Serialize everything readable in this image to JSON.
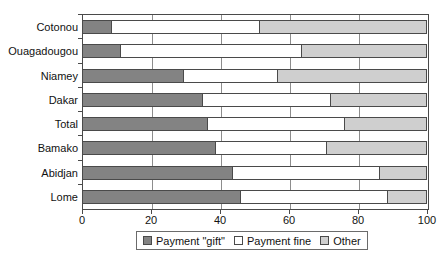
{
  "chart_data": {
    "type": "bar",
    "orientation": "horizontal",
    "stacked": true,
    "stack_mode": "percent",
    "title": "",
    "xlabel": "",
    "ylabel": "",
    "xlim": [
      0,
      100
    ],
    "xticks": [
      0,
      20,
      40,
      60,
      80,
      100
    ],
    "xtick_labels": [
      "0",
      "20",
      "40",
      "60",
      "80",
      "100"
    ],
    "grid": "vertical",
    "legend_position": "bottom",
    "categories": [
      "Cotonou",
      "Ouagadougou",
      "Niamey",
      "Dakar",
      "Total",
      "Bamako",
      "Abidjan",
      "Lome"
    ],
    "series": [
      {
        "name": "Payment \"gift\"",
        "color": "#838383",
        "values": [
          8.7,
          11.3,
          29.6,
          35.2,
          36.4,
          38.8,
          43.8,
          46.1
        ]
      },
      {
        "name": "Payment fine",
        "color": "#ffffff",
        "values": [
          42.9,
          52.5,
          27.2,
          37.1,
          39.8,
          32.2,
          42.6,
          42.6
        ]
      },
      {
        "name": "Other",
        "color": "#cfcfcf",
        "values": [
          48.4,
          36.2,
          43.2,
          27.7,
          23.8,
          29.0,
          13.6,
          11.3
        ]
      }
    ],
    "cumulative_boundaries": [
      [
        8.7,
        51.6
      ],
      [
        11.3,
        63.8
      ],
      [
        29.6,
        56.8
      ],
      [
        35.2,
        72.3
      ],
      [
        36.4,
        76.2
      ],
      [
        38.8,
        71.0
      ],
      [
        43.8,
        86.4
      ],
      [
        46.1,
        88.7
      ]
    ]
  },
  "legend": {
    "items": [
      {
        "label": "Payment \"gift\"",
        "swatch": "gift"
      },
      {
        "label": "Payment fine",
        "swatch": "fine"
      },
      {
        "label": "Other",
        "swatch": "other"
      }
    ]
  },
  "colors": {
    "gift": "#838383",
    "fine": "#ffffff",
    "other": "#cfcfcf",
    "axis": "#4a4a4a",
    "grid": "#8d8d8d",
    "text": "#111111",
    "background": "#ffffff"
  }
}
